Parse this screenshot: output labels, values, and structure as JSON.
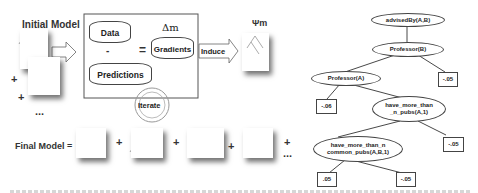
{
  "left_diagram": {
    "initial_model_label": "Initial Model",
    "data_label": "Data",
    "minus": "-",
    "predictions_label": "Predictions",
    "equals": "=",
    "delta_label": "Δm",
    "gradients_label": "Gradients",
    "induce_label": "Induce",
    "psi_label": "Ψm",
    "iterate_label": "Iterate",
    "final_model_label": "Final Model =",
    "plus": "+",
    "ellipsis": "..."
  },
  "regression_tree": {
    "root": "advisedBy(A,B)",
    "node2": "Professor(B)",
    "node3": "Professor(A)",
    "node4_line1": "have_more_than",
    "node4_line2": "_n_pubs(A,1)",
    "node5_line1": "have_more_than_n",
    "node5_line2": "common_pubs(A,B,1)",
    "leaves": [
      "-.05",
      "-.06",
      "-.05",
      ".05",
      "-.05"
    ]
  }
}
